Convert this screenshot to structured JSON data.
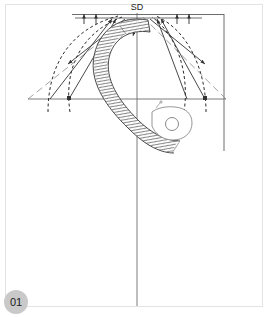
{
  "page": {
    "badge_label": "01",
    "badge_color": "#c9c9c9",
    "background": "#ffffff",
    "frame_color": "#e3e3e3",
    "width": 272,
    "height": 317
  },
  "diagram": {
    "title_label": "SD",
    "type": "engineering-hook-stress-diagram",
    "line_color": "#3c3c3c",
    "construction_color": "#7a7a7a",
    "hatch_color": "#555555",
    "labels": [
      {
        "text": "SD",
        "x": 137,
        "y": 10
      }
    ],
    "axes": {
      "vertical_centerline": {
        "x": 137,
        "y1": 12,
        "y2": 306
      },
      "horizontal_baseline": {
        "y": 99,
        "x1": 28,
        "x2": 226
      },
      "top_rule": {
        "y": 16,
        "x1": 72,
        "x2": 205
      },
      "right_vertical": {
        "x": 224,
        "y1": 14,
        "y2": 151
      },
      "top_right_rule": {
        "y": 14,
        "x1": 137,
        "x2": 224
      }
    },
    "force_vectors": [
      {
        "name": "left-outer-arrow",
        "x1": 28,
        "y1": 99,
        "x2": 108,
        "y2": 18
      },
      {
        "name": "left-inner-arrow",
        "x1": 50,
        "y1": 99,
        "x2": 112,
        "y2": 18
      },
      {
        "name": "left-crossing-arrow",
        "x1": 122,
        "y1": 18,
        "x2": 68,
        "y2": 66
      },
      {
        "name": "right-outer-arrow",
        "x1": 226,
        "y1": 99,
        "x2": 164,
        "y2": 18
      },
      {
        "name": "right-inner-arrow",
        "x1": 205,
        "y1": 99,
        "x2": 160,
        "y2": 18
      },
      {
        "name": "right-crossing-arrow",
        "x1": 152,
        "y1": 18,
        "x2": 206,
        "y2": 66
      }
    ],
    "dashed_curves": [
      {
        "name": "left-dashed-parabola"
      },
      {
        "name": "right-dashed-parabola"
      }
    ],
    "hook_body": {
      "name": "hatched-hook-band",
      "hole_center": {
        "x": 168,
        "y": 120
      },
      "hole_radius": 6
    }
  }
}
